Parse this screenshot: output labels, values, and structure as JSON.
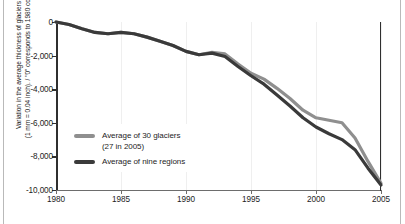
{
  "figure": {
    "name": "glacier-thickness-variation-chart",
    "background": "#ffffff"
  },
  "axes": {
    "y_title_line1": "Variation in the average thickness of glaciers (mm)",
    "y_title_line2": "(1 mm = 0.04 inch). / \"0\" corresponds to 1980 conditions.",
    "y_ticks": [
      "0",
      "-2,000",
      "-4,000",
      "-6,000",
      "-8,000",
      "-10,000"
    ],
    "x_ticks": [
      "1980",
      "1985",
      "1990",
      "1995",
      "2000",
      "2005"
    ]
  },
  "legend": {
    "items": [
      {
        "label": "Average of 30 glaciers\n(27 in 2005)",
        "color": "#8f8f8f"
      },
      {
        "label": "Average of nine regions",
        "color": "#3a3a3a"
      }
    ]
  },
  "chart_data": {
    "type": "line",
    "title": "",
    "xlabel": "",
    "ylabel": "Variation in the average thickness of glaciers (mm) (1 mm = 0.04 inch). / \"0\" corresponds to 1980 conditions.",
    "xlim": [
      1980,
      2005
    ],
    "ylim": [
      -10000,
      0
    ],
    "grid": "vertical-faint",
    "legend_position": "inside-lower-left",
    "x": [
      1980,
      1981,
      1982,
      1983,
      1984,
      1985,
      1986,
      1987,
      1988,
      1989,
      1990,
      1991,
      1992,
      1993,
      1994,
      1995,
      1996,
      1997,
      1998,
      1999,
      2000,
      2001,
      2002,
      2003,
      2004,
      2005
    ],
    "series": [
      {
        "name": "Average of 30 glaciers (27 in 2005)",
        "color": "#8f8f8f",
        "values": [
          0,
          -150,
          -400,
          -620,
          -700,
          -620,
          -700,
          -900,
          -1150,
          -1400,
          -1750,
          -1950,
          -1800,
          -1900,
          -2500,
          -3050,
          -3400,
          -3950,
          -4550,
          -5250,
          -5700,
          -5850,
          -6000,
          -6900,
          -8300,
          -9600
        ]
      },
      {
        "name": "Average of nine regions",
        "color": "#3a3a3a",
        "values": [
          0,
          -150,
          -400,
          -620,
          -700,
          -620,
          -700,
          -900,
          -1150,
          -1400,
          -1750,
          -1950,
          -1850,
          -2050,
          -2650,
          -3200,
          -3700,
          -4350,
          -5000,
          -5700,
          -6250,
          -6650,
          -7000,
          -7600,
          -8700,
          -9700
        ]
      }
    ]
  }
}
